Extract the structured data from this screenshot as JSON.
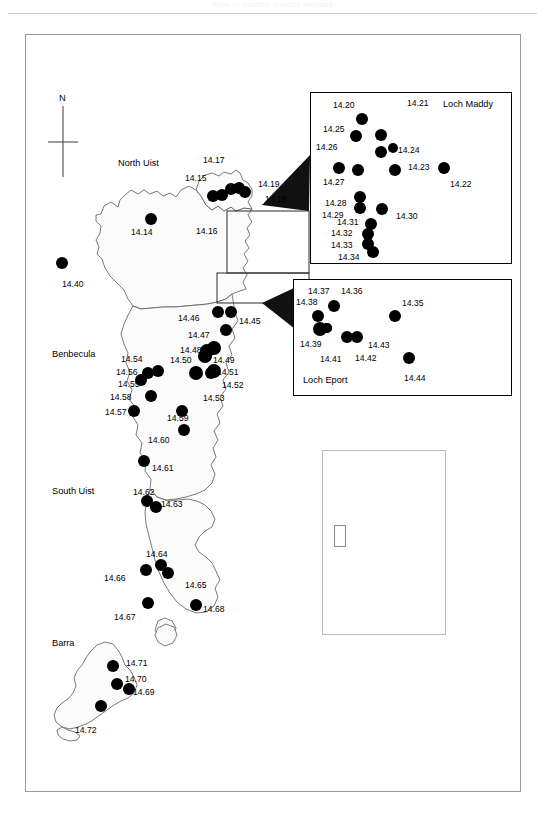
{
  "page": {
    "header_text": "Atlas of Scottish Coastal Habitats"
  },
  "figure": {
    "north_arrow_label": "N",
    "region_labels": [
      {
        "name": "north-uist",
        "text": "North Uist",
        "x": 118,
        "y": 158
      },
      {
        "name": "benbecula",
        "text": "Benbecula",
        "x": 52,
        "y": 349
      },
      {
        "name": "south-uist",
        "text": "South Uist",
        "x": 52,
        "y": 486
      },
      {
        "name": "barra",
        "text": "Barra",
        "x": 52,
        "y": 638
      }
    ],
    "insets": [
      {
        "name": "loch-maddy",
        "title": "Loch Maddy",
        "title_x": 443,
        "title_y": 99,
        "x": 310,
        "y": 92,
        "w": 202,
        "h": 172
      },
      {
        "name": "loch-eport",
        "title": "Loch Eport",
        "title_x": 303,
        "title_y": 375,
        "x": 293,
        "y": 279,
        "w": 219,
        "h": 117
      },
      {
        "name": "uk-locator",
        "title": "",
        "title_x": 0,
        "title_y": 0,
        "x": 322,
        "y": 450,
        "w": 124,
        "h": 185
      }
    ],
    "site_labels": [
      {
        "id": "14.14",
        "x": 131,
        "y": 228
      },
      {
        "id": "14.15",
        "x": 185,
        "y": 174
      },
      {
        "id": "14.16",
        "x": 196,
        "y": 227
      },
      {
        "id": "14.17",
        "x": 203,
        "y": 156
      },
      {
        "id": "14.18",
        "x": 265,
        "y": 195
      },
      {
        "id": "14.19",
        "x": 258,
        "y": 180
      },
      {
        "id": "14.20",
        "x": 333,
        "y": 101
      },
      {
        "id": "14.21",
        "x": 407,
        "y": 99
      },
      {
        "id": "14.22",
        "x": 450,
        "y": 180
      },
      {
        "id": "14.23",
        "x": 408,
        "y": 163
      },
      {
        "id": "14.24",
        "x": 398,
        "y": 146
      },
      {
        "id": "14.25",
        "x": 323,
        "y": 125
      },
      {
        "id": "14.26",
        "x": 316,
        "y": 143
      },
      {
        "id": "14.27",
        "x": 323,
        "y": 178
      },
      {
        "id": "14.28",
        "x": 325,
        "y": 199
      },
      {
        "id": "14.29",
        "x": 322,
        "y": 211
      },
      {
        "id": "14.30",
        "x": 396,
        "y": 212
      },
      {
        "id": "14.31",
        "x": 337,
        "y": 218
      },
      {
        "id": "14.32",
        "x": 331,
        "y": 229
      },
      {
        "id": "14.33",
        "x": 331,
        "y": 241
      },
      {
        "id": "14.34",
        "x": 338,
        "y": 253
      },
      {
        "id": "14.35",
        "x": 402,
        "y": 299
      },
      {
        "id": "14.36",
        "x": 341,
        "y": 287
      },
      {
        "id": "14.37",
        "x": 308,
        "y": 287
      },
      {
        "id": "14.38",
        "x": 296,
        "y": 298
      },
      {
        "id": "14.39",
        "x": 300,
        "y": 340
      },
      {
        "id": "14.40",
        "x": 62,
        "y": 280
      },
      {
        "id": "14.41",
        "x": 320,
        "y": 355
      },
      {
        "id": "14.42",
        "x": 355,
        "y": 354
      },
      {
        "id": "14.43",
        "x": 368,
        "y": 341
      },
      {
        "id": "14.44",
        "x": 404,
        "y": 374
      },
      {
        "id": "14.45",
        "x": 239,
        "y": 317
      },
      {
        "id": "14.46",
        "x": 178,
        "y": 314
      },
      {
        "id": "14.47",
        "x": 188,
        "y": 331
      },
      {
        "id": "14.48",
        "x": 180,
        "y": 346
      },
      {
        "id": "14.49",
        "x": 213,
        "y": 356
      },
      {
        "id": "14.50",
        "x": 170,
        "y": 356
      },
      {
        "id": "14.51",
        "x": 217,
        "y": 368
      },
      {
        "id": "14.52",
        "x": 222,
        "y": 381
      },
      {
        "id": "14.53",
        "x": 203,
        "y": 394
      },
      {
        "id": "14.54",
        "x": 121,
        "y": 355
      },
      {
        "id": "14.55",
        "x": 118,
        "y": 380
      },
      {
        "id": "14.56",
        "x": 116,
        "y": 368
      },
      {
        "id": "14.57",
        "x": 105,
        "y": 408
      },
      {
        "id": "14.58",
        "x": 110,
        "y": 393
      },
      {
        "id": "14.59",
        "x": 167,
        "y": 414
      },
      {
        "id": "14.60",
        "x": 148,
        "y": 436
      },
      {
        "id": "14.61",
        "x": 152,
        "y": 464
      },
      {
        "id": "14.62",
        "x": 133,
        "y": 488
      },
      {
        "id": "14.63",
        "x": 161,
        "y": 500
      },
      {
        "id": "14.64",
        "x": 146,
        "y": 550
      },
      {
        "id": "14.65",
        "x": 185,
        "y": 581
      },
      {
        "id": "14.66",
        "x": 104,
        "y": 574
      },
      {
        "id": "14.67",
        "x": 114,
        "y": 613
      },
      {
        "id": "14.68",
        "x": 203,
        "y": 605
      },
      {
        "id": "14.69",
        "x": 133,
        "y": 688
      },
      {
        "id": "14.70",
        "x": 125,
        "y": 675
      },
      {
        "id": "14.71",
        "x": 126,
        "y": 659
      },
      {
        "id": "14.72",
        "x": 75,
        "y": 726
      }
    ],
    "site_dots": [
      {
        "id": "14.14",
        "x": 151,
        "y": 219,
        "r": 6
      },
      {
        "id": "14.15",
        "x": 213,
        "y": 196,
        "r": 6
      },
      {
        "id": "14.16",
        "x": 222,
        "y": 195,
        "r": 6
      },
      {
        "id": "14.17",
        "x": 231,
        "y": 189,
        "r": 6
      },
      {
        "id": "14.18",
        "x": 245,
        "y": 192,
        "r": 6
      },
      {
        "id": "14.19",
        "x": 239,
        "y": 188,
        "r": 6
      },
      {
        "id": "14.40",
        "x": 62,
        "y": 263,
        "r": 6
      },
      {
        "id": "14.20",
        "x": 362,
        "y": 119,
        "r": 6
      },
      {
        "id": "14.21",
        "x": 381,
        "y": 135,
        "r": 6
      },
      {
        "id": "14.25",
        "x": 356,
        "y": 136,
        "r": 6
      },
      {
        "id": "14.26",
        "x": 381,
        "y": 152,
        "r": 6
      },
      {
        "id": "14.24",
        "x": 393,
        "y": 148,
        "r": 5
      },
      {
        "id": "14.23",
        "x": 395,
        "y": 170,
        "r": 6
      },
      {
        "id": "14.22",
        "x": 444,
        "y": 168,
        "r": 6
      },
      {
        "id": "14.27",
        "x": 339,
        "y": 168,
        "r": 6
      },
      {
        "id": "14.27b",
        "x": 358,
        "y": 170,
        "r": 6
      },
      {
        "id": "14.28",
        "x": 360,
        "y": 197,
        "r": 6
      },
      {
        "id": "14.29",
        "x": 360,
        "y": 208,
        "r": 6
      },
      {
        "id": "14.30",
        "x": 382,
        "y": 209,
        "r": 6
      },
      {
        "id": "14.31",
        "x": 371,
        "y": 224,
        "r": 6
      },
      {
        "id": "14.32",
        "x": 368,
        "y": 234,
        "r": 6
      },
      {
        "id": "14.33",
        "x": 368,
        "y": 244,
        "r": 6
      },
      {
        "id": "14.34",
        "x": 373,
        "y": 252,
        "r": 6
      },
      {
        "id": "14.36",
        "x": 334,
        "y": 306,
        "r": 6
      },
      {
        "id": "14.38",
        "x": 318,
        "y": 316,
        "r": 6
      },
      {
        "id": "14.38b",
        "x": 320,
        "y": 329,
        "r": 7
      },
      {
        "id": "14.39",
        "x": 327,
        "y": 328,
        "r": 5
      },
      {
        "id": "14.41",
        "x": 327,
        "y": 328,
        "r": 5
      },
      {
        "id": "14.42",
        "x": 347,
        "y": 337,
        "r": 6
      },
      {
        "id": "14.43",
        "x": 357,
        "y": 337,
        "r": 6
      },
      {
        "id": "14.35",
        "x": 395,
        "y": 316,
        "r": 6
      },
      {
        "id": "14.44",
        "x": 409,
        "y": 358,
        "r": 6
      },
      {
        "id": "14.46",
        "x": 218,
        "y": 312,
        "r": 6
      },
      {
        "id": "14.45",
        "x": 231,
        "y": 312,
        "r": 6
      },
      {
        "id": "14.47",
        "x": 226,
        "y": 330,
        "r": 6
      },
      {
        "id": "14.48",
        "x": 214,
        "y": 348,
        "r": 7
      },
      {
        "id": "14.50",
        "x": 205,
        "y": 356,
        "r": 7
      },
      {
        "id": "14.49",
        "x": 207,
        "y": 351,
        "r": 7
      },
      {
        "id": "14.51",
        "x": 214,
        "y": 371,
        "r": 7
      },
      {
        "id": "14.52",
        "x": 211,
        "y": 373,
        "r": 6
      },
      {
        "id": "14.53",
        "x": 196,
        "y": 373,
        "r": 7
      },
      {
        "id": "14.54",
        "x": 158,
        "y": 371,
        "r": 6
      },
      {
        "id": "14.56",
        "x": 148,
        "y": 373,
        "r": 6
      },
      {
        "id": "14.55",
        "x": 141,
        "y": 380,
        "r": 6
      },
      {
        "id": "14.58",
        "x": 151,
        "y": 396,
        "r": 6
      },
      {
        "id": "14.57",
        "x": 134,
        "y": 411,
        "r": 6
      },
      {
        "id": "14.59",
        "x": 182,
        "y": 411,
        "r": 6
      },
      {
        "id": "14.60",
        "x": 184,
        "y": 430,
        "r": 6
      },
      {
        "id": "14.61",
        "x": 144,
        "y": 461,
        "r": 6
      },
      {
        "id": "14.62",
        "x": 147,
        "y": 501,
        "r": 6
      },
      {
        "id": "14.63",
        "x": 156,
        "y": 507,
        "r": 6
      },
      {
        "id": "14.64",
        "x": 161,
        "y": 565,
        "r": 6
      },
      {
        "id": "14.66",
        "x": 146,
        "y": 570,
        "r": 6
      },
      {
        "id": "14.65",
        "x": 168,
        "y": 573,
        "r": 6
      },
      {
        "id": "14.67",
        "x": 148,
        "y": 603,
        "r": 6
      },
      {
        "id": "14.68",
        "x": 196,
        "y": 605,
        "r": 6
      },
      {
        "id": "14.71",
        "x": 113,
        "y": 666,
        "r": 6
      },
      {
        "id": "14.70",
        "x": 117,
        "y": 684,
        "r": 6
      },
      {
        "id": "14.69",
        "x": 129,
        "y": 689,
        "r": 6
      },
      {
        "id": "14.72",
        "x": 101,
        "y": 706,
        "r": 6
      }
    ]
  },
  "chart_data": {
    "type": "map",
    "regions": [
      "North Uist",
      "Benbecula",
      "South Uist",
      "Barra"
    ],
    "insets": [
      "Loch Maddy",
      "Loch Eport",
      "UK locator"
    ],
    "site_count": 59,
    "site_ids": [
      "14.14",
      "14.15",
      "14.16",
      "14.17",
      "14.18",
      "14.19",
      "14.20",
      "14.21",
      "14.22",
      "14.23",
      "14.24",
      "14.25",
      "14.26",
      "14.27",
      "14.28",
      "14.29",
      "14.30",
      "14.31",
      "14.32",
      "14.33",
      "14.34",
      "14.35",
      "14.36",
      "14.37",
      "14.38",
      "14.39",
      "14.40",
      "14.41",
      "14.42",
      "14.43",
      "14.44",
      "14.45",
      "14.46",
      "14.47",
      "14.48",
      "14.49",
      "14.50",
      "14.51",
      "14.52",
      "14.53",
      "14.54",
      "14.55",
      "14.56",
      "14.57",
      "14.58",
      "14.59",
      "14.60",
      "14.61",
      "14.62",
      "14.63",
      "14.64",
      "14.65",
      "14.66",
      "14.67",
      "14.68",
      "14.69",
      "14.70",
      "14.71",
      "14.72"
    ]
  }
}
